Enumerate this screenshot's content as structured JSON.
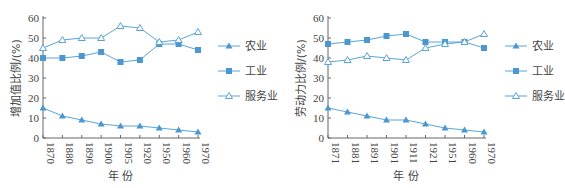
{
  "colors": {
    "line": "#5aa5d8",
    "marker": "#4a97d1",
    "axis": "#666666",
    "text": "#444444"
  },
  "chart_data": [
    {
      "type": "line",
      "title": "",
      "xlabel": "年 份",
      "ylabel": "增加值比例/(%)",
      "ylim": [
        0,
        60
      ],
      "yticks": [
        0,
        10,
        20,
        30,
        40,
        50,
        60
      ],
      "categories": [
        "1870",
        "1880",
        "1890",
        "1900",
        "1905",
        "1920",
        "1950",
        "1960",
        "1970"
      ],
      "legend_position": "right",
      "series": [
        {
          "name": "农业",
          "marker": "filled-triangle",
          "values": [
            15,
            11,
            9,
            7,
            6,
            6,
            5,
            4,
            3
          ]
        },
        {
          "name": "工业",
          "marker": "filled-square",
          "values": [
            40,
            40,
            41,
            43,
            38,
            39,
            47,
            47,
            44
          ]
        },
        {
          "name": "服务业",
          "marker": "hollow-triangle",
          "values": [
            45,
            49,
            50,
            50,
            56,
            55,
            48,
            49,
            53
          ]
        }
      ]
    },
    {
      "type": "line",
      "title": "",
      "xlabel": "年 份",
      "ylabel": "劳动力比例/(%)",
      "ylim": [
        0,
        60
      ],
      "yticks": [
        0,
        10,
        20,
        30,
        40,
        50,
        60
      ],
      "categories": [
        "1871",
        "1881",
        "1891",
        "1901",
        "1911",
        "1921",
        "1951",
        "1960",
        "1970"
      ],
      "legend_position": "right",
      "series": [
        {
          "name": "农业",
          "marker": "filled-triangle",
          "values": [
            15,
            13,
            11,
            9,
            9,
            7,
            5,
            4,
            3
          ]
        },
        {
          "name": "工业",
          "marker": "filled-square",
          "values": [
            47,
            48,
            49,
            51,
            52,
            48,
            48,
            48,
            45
          ]
        },
        {
          "name": "服务业",
          "marker": "hollow-triangle",
          "values": [
            38,
            39,
            41,
            40,
            39,
            45,
            47,
            48,
            52
          ]
        }
      ]
    }
  ]
}
